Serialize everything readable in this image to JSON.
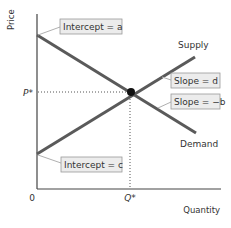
{
  "diagram": {
    "type": "supply-demand",
    "axes": {
      "y_label": "Price",
      "x_label": "Quantity",
      "origin_label": "0"
    },
    "equilibrium": {
      "price_label": "P*",
      "quantity_label": "Q*"
    },
    "curves": {
      "supply": {
        "label": "Supply",
        "slope_label": "Slope = d",
        "intercept_label": "Intercept = c"
      },
      "demand": {
        "label": "Demand",
        "slope_label": "Slope = −b",
        "intercept_label": "Intercept = a"
      }
    },
    "colors": {
      "curve": "#5a5a5a",
      "axis": "#444444",
      "callout_fill": "#ececec",
      "callout_stroke": "#9a9a9a",
      "leader": "#b0b0b0",
      "point": "#111111"
    }
  }
}
